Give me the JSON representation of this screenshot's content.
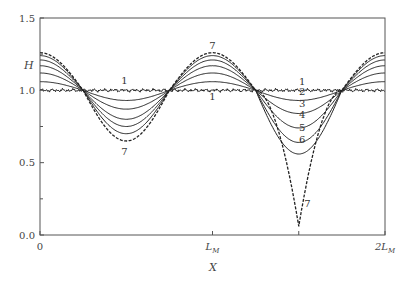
{
  "chart_data": {
    "type": "line",
    "title": "",
    "xlabel": "X",
    "ylabel": "H",
    "xlim": [
      0,
      2
    ],
    "ylim": [
      0,
      1.5
    ],
    "x_unit": "L_M",
    "x_ticks": [
      {
        "value": 0,
        "label": "0"
      },
      {
        "value": 1,
        "label": "L",
        "sub": "M"
      },
      {
        "value": 2,
        "label": "2L",
        "sub": "M"
      }
    ],
    "y_ticks": [
      {
        "value": 0.0,
        "label": "0.0"
      },
      {
        "value": 0.5,
        "label": "0.5"
      },
      {
        "value": 1.0,
        "label": "1.0"
      },
      {
        "value": 1.5,
        "label": "1.5"
      }
    ],
    "y_minor_ticks": [
      0.25,
      0.75,
      1.25
    ],
    "grid": false,
    "legend": "inline curve labels 1-7",
    "series": [
      {
        "name": "1",
        "style": "solid-noisy",
        "amp_left": 0.0,
        "min_right": 1.0,
        "max": 1.0
      },
      {
        "name": "2",
        "style": "solid",
        "min_left": 0.93,
        "min_right": 0.93,
        "max": 1.06
      },
      {
        "name": "3",
        "style": "solid",
        "min_left": 0.87,
        "min_right": 0.84,
        "max": 1.12
      },
      {
        "name": "4",
        "style": "solid",
        "min_left": 0.8,
        "min_right": 0.74,
        "max": 1.17
      },
      {
        "name": "5",
        "style": "solid",
        "min_left": 0.75,
        "min_right": 0.64,
        "max": 1.21
      },
      {
        "name": "6",
        "style": "solid",
        "min_left": 0.7,
        "min_right": 0.56,
        "max": 1.24
      },
      {
        "name": "7",
        "style": "dashed",
        "min_left": 0.65,
        "min_right": 0.06,
        "max": 1.26
      }
    ],
    "annotations": [
      {
        "text": "1",
        "x": 0.49,
        "y": 1.07
      },
      {
        "text": "7",
        "x": 0.49,
        "y": 0.58
      },
      {
        "text": "7",
        "x": 1.0,
        "y": 1.31
      },
      {
        "text": "1",
        "x": 1.0,
        "y": 0.96
      },
      {
        "text": "1",
        "x": 1.52,
        "y": 1.06
      },
      {
        "text": "2",
        "x": 1.52,
        "y": 0.99
      },
      {
        "text": "3",
        "x": 1.52,
        "y": 0.91
      },
      {
        "text": "4",
        "x": 1.52,
        "y": 0.83
      },
      {
        "text": "5",
        "x": 1.52,
        "y": 0.74
      },
      {
        "text": "6",
        "x": 1.52,
        "y": 0.66
      },
      {
        "text": "7",
        "x": 1.55,
        "y": 0.22
      }
    ]
  },
  "labels": {
    "ylabel": "H",
    "xlabel": "X"
  }
}
